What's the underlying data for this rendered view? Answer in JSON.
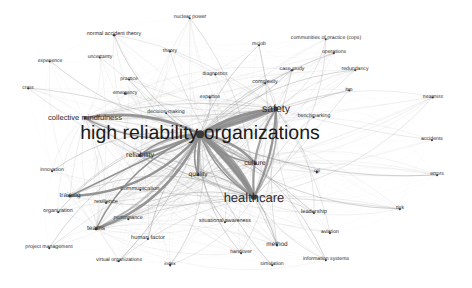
{
  "figure": {
    "type": "network-map",
    "background": "#ffffff",
    "node_color": "#3a3a3a",
    "label_color": "#2b2b2b",
    "edge_color": "#8c8c8c",
    "width": 472,
    "height": 288
  },
  "chart_data": {
    "type": "scatter",
    "title": "",
    "xlabel": "",
    "ylabel": "",
    "grid": false,
    "legend": "none",
    "nodes": [
      {
        "label": "high reliability organizations",
        "x": 200,
        "y": 134,
        "size": 19.5,
        "weight": 100
      },
      {
        "label": "healthcare",
        "x": 254,
        "y": 197,
        "size": 13.0,
        "weight": 72
      },
      {
        "label": "safety",
        "x": 276,
        "y": 109,
        "size": 10.5,
        "weight": 58
      },
      {
        "label": "collective mindfulness",
        "x": 85,
        "y": 118,
        "size": 7.6,
        "weight": 34
      },
      {
        "label": "reliability",
        "x": 140,
        "y": 155,
        "size": 7.2,
        "weight": 31
      },
      {
        "label": "culture",
        "x": 255,
        "y": 163,
        "size": 7.2,
        "weight": 31
      },
      {
        "label": "quality",
        "x": 198,
        "y": 175,
        "size": 6.6,
        "weight": 28
      },
      {
        "label": "teams",
        "x": 96,
        "y": 229,
        "size": 6.6,
        "weight": 28
      },
      {
        "label": "training",
        "x": 70,
        "y": 196,
        "size": 6.4,
        "weight": 27
      },
      {
        "label": "method",
        "x": 277,
        "y": 245,
        "size": 6.4,
        "weight": 27
      },
      {
        "label": "communication",
        "x": 140,
        "y": 190,
        "size": 5.8,
        "weight": 23
      },
      {
        "label": "human factor",
        "x": 148,
        "y": 239,
        "size": 5.8,
        "weight": 23
      },
      {
        "label": "resilience",
        "x": 106,
        "y": 203,
        "size": 5.6,
        "weight": 22
      },
      {
        "label": "leadership",
        "x": 314,
        "y": 213,
        "size": 5.6,
        "weight": 22
      },
      {
        "label": "situational awareness",
        "x": 225,
        "y": 222,
        "size": 5.4,
        "weight": 21
      },
      {
        "label": "complexity",
        "x": 265,
        "y": 83,
        "size": 5.4,
        "weight": 21
      },
      {
        "label": "organization",
        "x": 58,
        "y": 212,
        "size": 5.4,
        "weight": 21
      },
      {
        "label": "performance",
        "x": 128,
        "y": 219,
        "size": 5.2,
        "weight": 20
      },
      {
        "label": "aviation",
        "x": 330,
        "y": 233,
        "size": 5.2,
        "weight": 20
      },
      {
        "label": "decision-making",
        "x": 166,
        "y": 113,
        "size": 5.2,
        "weight": 20
      },
      {
        "label": "risk",
        "x": 400,
        "y": 209,
        "size": 5.2,
        "weight": 20
      },
      {
        "label": "case study",
        "x": 292,
        "y": 70,
        "size": 5.2,
        "weight": 20
      },
      {
        "label": "operations",
        "x": 334,
        "y": 53,
        "size": 5.2,
        "weight": 20
      },
      {
        "label": "redundancy",
        "x": 355,
        "y": 70,
        "size": 5.2,
        "weight": 20
      },
      {
        "label": "normal accident theory",
        "x": 114,
        "y": 35,
        "size": 5.4,
        "weight": 21
      },
      {
        "label": "virtual organizations",
        "x": 119,
        "y": 261,
        "size": 5.2,
        "weight": 20
      },
      {
        "label": "project management",
        "x": 49,
        "y": 248,
        "size": 5.2,
        "weight": 20
      },
      {
        "label": "simulation",
        "x": 272,
        "y": 265,
        "size": 5.2,
        "weight": 20
      },
      {
        "label": "information systems",
        "x": 326,
        "y": 260,
        "size": 5.2,
        "weight": 20
      },
      {
        "label": "handover",
        "x": 241,
        "y": 253,
        "size": 5.2,
        "weight": 20
      },
      {
        "label": "innovation",
        "x": 52,
        "y": 171,
        "size": 5.2,
        "weight": 20
      },
      {
        "label": "communities of practice (cops)",
        "x": 326,
        "y": 39,
        "size": 5.2,
        "weight": 20
      },
      {
        "label": "benchmarking",
        "x": 314,
        "y": 117,
        "size": 5.2,
        "weight": 20
      },
      {
        "label": "accidents",
        "x": 432,
        "y": 140,
        "size": 5.2,
        "weight": 20
      },
      {
        "label": "errors",
        "x": 437,
        "y": 175,
        "size": 5.2,
        "weight": 20
      },
      {
        "label": "nearmiss",
        "x": 433,
        "y": 97,
        "size": 5.0,
        "weight": 18
      },
      {
        "label": "diagnostics",
        "x": 215,
        "y": 74,
        "size": 5.0,
        "weight": 18
      },
      {
        "label": "expertise",
        "x": 210,
        "y": 97,
        "size": 5.0,
        "weight": 18
      },
      {
        "label": "practice",
        "x": 129,
        "y": 79,
        "size": 5.0,
        "weight": 18
      },
      {
        "label": "emergency",
        "x": 125,
        "y": 93,
        "size": 5.0,
        "weight": 18
      },
      {
        "label": "uncertainty",
        "x": 100,
        "y": 57,
        "size": 5.0,
        "weight": 18
      },
      {
        "label": "experience",
        "x": 50,
        "y": 61,
        "size": 5.0,
        "weight": 18
      },
      {
        "label": "crisis",
        "x": 28,
        "y": 88,
        "size": 5.0,
        "weight": 18
      },
      {
        "label": "theory",
        "x": 170,
        "y": 51,
        "size": 5.0,
        "weight": 18
      },
      {
        "label": "nuclear power",
        "x": 190,
        "y": 18,
        "size": 5.2,
        "weight": 20
      },
      {
        "label": "mcjob",
        "x": 259,
        "y": 45,
        "size": 5.2,
        "weight": 20
      },
      {
        "label": "hro",
        "x": 349,
        "y": 90,
        "size": 5.0,
        "weight": 18
      },
      {
        "label": "cqi",
        "x": 317,
        "y": 172,
        "size": 4.8,
        "weight": 16
      },
      {
        "label": "index",
        "x": 170,
        "y": 265,
        "size": 4.8,
        "weight": 16
      }
    ],
    "edges_note": "dense grayscale curved links radiating from the central hub to all peripheral keyword nodes"
  }
}
